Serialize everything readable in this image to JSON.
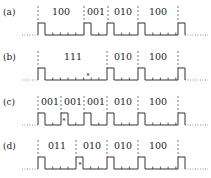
{
  "panels": [
    {
      "label": "(a)",
      "codes": [
        {
          "text": "100",
          "x": 61
        },
        {
          "text": "001",
          "x": 96
        },
        {
          "text": "010",
          "x": 123
        },
        {
          "text": "100",
          "x": 158
        }
      ],
      "dividers": [
        38,
        84,
        108,
        138,
        178
      ],
      "pulses": [
        38,
        84,
        107,
        138,
        178
      ],
      "marker_x": null
    },
    {
      "label": "(b)",
      "codes": [
        {
          "text": "111",
          "x": 73
        },
        {
          "text": "010",
          "x": 123
        },
        {
          "text": "100",
          "x": 158
        }
      ],
      "dividers": [
        38,
        107,
        138,
        178
      ],
      "pulses": [
        38,
        107,
        138,
        178
      ],
      "marker_x": 88
    },
    {
      "label": "(c)",
      "codes": [
        {
          "text": "001",
          "x": 50
        },
        {
          "text": "001",
          "x": 73
        },
        {
          "text": "001",
          "x": 96
        },
        {
          "text": "010",
          "x": 123
        },
        {
          "text": "100",
          "x": 158
        }
      ],
      "dividers": [
        38,
        61,
        84,
        107,
        138,
        178
      ],
      "pulses": [
        38,
        61,
        84,
        107,
        138,
        178
      ],
      "marker_x": 64
    },
    {
      "label": "(d)",
      "codes": [
        {
          "text": "011",
          "x": 57
        },
        {
          "text": "010",
          "x": 92
        },
        {
          "text": "010",
          "x": 123
        },
        {
          "text": "100",
          "x": 158
        }
      ],
      "dividers": [
        38,
        76,
        107,
        138,
        178
      ],
      "pulses": [
        38,
        76,
        107,
        138,
        178
      ],
      "marker_x": 80
    }
  ],
  "layout": {
    "panel_y": [
      8,
      53,
      98,
      142
    ],
    "pulse_width": 7,
    "tick_spacing": 7.7,
    "x_start": 22,
    "x_end": 200
  }
}
